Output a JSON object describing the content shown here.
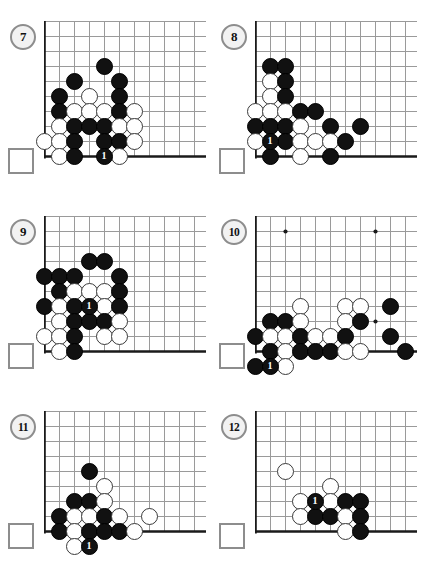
{
  "page": {
    "width": 415,
    "height": 570,
    "background": "#ffffff",
    "black_color": "#111111",
    "white_color": "#ffffff",
    "line_color": "#9a9a9a",
    "edge_color": "#1a1a1a",
    "marker_color": "#8d8d8d"
  },
  "layout": {
    "cell": 15,
    "stone_diameter": 17,
    "cols": 11,
    "rows": 10
  },
  "diagrams": [
    {
      "number": "7",
      "badge_label": "7",
      "square_marker": true,
      "origin_x": 44,
      "origin_y": 21,
      "cols": 11,
      "rows": 10,
      "star_points": [],
      "edges": [
        "left",
        "bottom"
      ],
      "stones": [
        {
          "c": 4,
          "r": 3,
          "color": "b",
          "label": ""
        },
        {
          "c": 2,
          "r": 4,
          "color": "b",
          "label": ""
        },
        {
          "c": 5,
          "r": 4,
          "color": "b",
          "label": ""
        },
        {
          "c": 1,
          "r": 5,
          "color": "b",
          "label": ""
        },
        {
          "c": 3,
          "r": 5,
          "color": "w",
          "label": ""
        },
        {
          "c": 5,
          "r": 5,
          "color": "b",
          "label": ""
        },
        {
          "c": 1,
          "r": 6,
          "color": "b",
          "label": ""
        },
        {
          "c": 2,
          "r": 6,
          "color": "w",
          "label": ""
        },
        {
          "c": 3,
          "r": 6,
          "color": "w",
          "label": ""
        },
        {
          "c": 4,
          "r": 6,
          "color": "w",
          "label": ""
        },
        {
          "c": 5,
          "r": 6,
          "color": "b",
          "label": ""
        },
        {
          "c": 6,
          "r": 6,
          "color": "w",
          "label": ""
        },
        {
          "c": 1,
          "r": 7,
          "color": "w",
          "label": ""
        },
        {
          "c": 2,
          "r": 7,
          "color": "b",
          "label": ""
        },
        {
          "c": 3,
          "r": 7,
          "color": "b",
          "label": ""
        },
        {
          "c": 4,
          "r": 7,
          "color": "b",
          "label": ""
        },
        {
          "c": 5,
          "r": 7,
          "color": "w",
          "label": ""
        },
        {
          "c": 6,
          "r": 7,
          "color": "w",
          "label": ""
        },
        {
          "c": 0,
          "r": 8,
          "color": "w",
          "label": ""
        },
        {
          "c": 1,
          "r": 8,
          "color": "w",
          "label": ""
        },
        {
          "c": 2,
          "r": 8,
          "color": "b",
          "label": ""
        },
        {
          "c": 4,
          "r": 8,
          "color": "b",
          "label": ""
        },
        {
          "c": 5,
          "r": 8,
          "color": "b",
          "label": ""
        },
        {
          "c": 6,
          "r": 8,
          "color": "w",
          "label": ""
        },
        {
          "c": 1,
          "r": 9,
          "color": "w",
          "label": ""
        },
        {
          "c": 2,
          "r": 9,
          "color": "b",
          "label": ""
        },
        {
          "c": 4,
          "r": 9,
          "color": "b",
          "label": "1"
        },
        {
          "c": 5,
          "r": 9,
          "color": "w",
          "label": ""
        }
      ]
    },
    {
      "number": "8",
      "badge_label": "8",
      "square_marker": true,
      "origin_x": 255,
      "origin_y": 21,
      "cols": 11,
      "rows": 10,
      "star_points": [],
      "edges": [
        "left",
        "bottom"
      ],
      "stones": [
        {
          "c": 1,
          "r": 3,
          "color": "b",
          "label": ""
        },
        {
          "c": 2,
          "r": 3,
          "color": "b",
          "label": ""
        },
        {
          "c": 1,
          "r": 4,
          "color": "w",
          "label": ""
        },
        {
          "c": 2,
          "r": 4,
          "color": "b",
          "label": ""
        },
        {
          "c": 1,
          "r": 5,
          "color": "w",
          "label": ""
        },
        {
          "c": 2,
          "r": 5,
          "color": "b",
          "label": ""
        },
        {
          "c": 0,
          "r": 6,
          "color": "w",
          "label": ""
        },
        {
          "c": 1,
          "r": 6,
          "color": "w",
          "label": ""
        },
        {
          "c": 2,
          "r": 6,
          "color": "w",
          "label": ""
        },
        {
          "c": 3,
          "r": 6,
          "color": "b",
          "label": ""
        },
        {
          "c": 4,
          "r": 6,
          "color": "b",
          "label": ""
        },
        {
          "c": 0,
          "r": 7,
          "color": "b",
          "label": ""
        },
        {
          "c": 1,
          "r": 7,
          "color": "b",
          "label": ""
        },
        {
          "c": 2,
          "r": 7,
          "color": "b",
          "label": ""
        },
        {
          "c": 3,
          "r": 7,
          "color": "w",
          "label": ""
        },
        {
          "c": 5,
          "r": 7,
          "color": "b",
          "label": ""
        },
        {
          "c": 7,
          "r": 7,
          "color": "b",
          "label": ""
        },
        {
          "c": 0,
          "r": 8,
          "color": "w",
          "label": ""
        },
        {
          "c": 1,
          "r": 8,
          "color": "b",
          "label": "1"
        },
        {
          "c": 2,
          "r": 8,
          "color": "b",
          "label": ""
        },
        {
          "c": 3,
          "r": 8,
          "color": "w",
          "label": ""
        },
        {
          "c": 4,
          "r": 8,
          "color": "w",
          "label": ""
        },
        {
          "c": 5,
          "r": 8,
          "color": "w",
          "label": ""
        },
        {
          "c": 6,
          "r": 8,
          "color": "b",
          "label": ""
        },
        {
          "c": 1,
          "r": 9,
          "color": "b",
          "label": ""
        },
        {
          "c": 3,
          "r": 9,
          "color": "w",
          "label": ""
        },
        {
          "c": 5,
          "r": 9,
          "color": "b",
          "label": ""
        }
      ]
    },
    {
      "number": "9",
      "badge_label": "9",
      "square_marker": true,
      "origin_x": 44,
      "origin_y": 216,
      "cols": 11,
      "rows": 10,
      "star_points": [],
      "edges": [
        "left",
        "bottom"
      ],
      "stones": [
        {
          "c": 3,
          "r": 3,
          "color": "b",
          "label": ""
        },
        {
          "c": 4,
          "r": 3,
          "color": "b",
          "label": ""
        },
        {
          "c": 0,
          "r": 4,
          "color": "b",
          "label": ""
        },
        {
          "c": 1,
          "r": 4,
          "color": "b",
          "label": ""
        },
        {
          "c": 2,
          "r": 4,
          "color": "b",
          "label": ""
        },
        {
          "c": 5,
          "r": 4,
          "color": "b",
          "label": ""
        },
        {
          "c": 1,
          "r": 5,
          "color": "b",
          "label": ""
        },
        {
          "c": 2,
          "r": 5,
          "color": "w",
          "label": ""
        },
        {
          "c": 3,
          "r": 5,
          "color": "w",
          "label": ""
        },
        {
          "c": 4,
          "r": 5,
          "color": "w",
          "label": ""
        },
        {
          "c": 5,
          "r": 5,
          "color": "b",
          "label": ""
        },
        {
          "c": 0,
          "r": 6,
          "color": "b",
          "label": ""
        },
        {
          "c": 1,
          "r": 6,
          "color": "w",
          "label": ""
        },
        {
          "c": 2,
          "r": 6,
          "color": "b",
          "label": ""
        },
        {
          "c": 3,
          "r": 6,
          "color": "b",
          "label": "1"
        },
        {
          "c": 4,
          "r": 6,
          "color": "w",
          "label": ""
        },
        {
          "c": 5,
          "r": 6,
          "color": "b",
          "label": ""
        },
        {
          "c": 1,
          "r": 7,
          "color": "w",
          "label": ""
        },
        {
          "c": 2,
          "r": 7,
          "color": "b",
          "label": ""
        },
        {
          "c": 3,
          "r": 7,
          "color": "b",
          "label": ""
        },
        {
          "c": 4,
          "r": 7,
          "color": "b",
          "label": ""
        },
        {
          "c": 5,
          "r": 7,
          "color": "w",
          "label": ""
        },
        {
          "c": 0,
          "r": 8,
          "color": "w",
          "label": ""
        },
        {
          "c": 1,
          "r": 8,
          "color": "w",
          "label": ""
        },
        {
          "c": 2,
          "r": 8,
          "color": "b",
          "label": ""
        },
        {
          "c": 4,
          "r": 8,
          "color": "w",
          "label": ""
        },
        {
          "c": 5,
          "r": 8,
          "color": "w",
          "label": ""
        },
        {
          "c": 1,
          "r": 9,
          "color": "w",
          "label": ""
        },
        {
          "c": 2,
          "r": 9,
          "color": "b",
          "label": ""
        }
      ]
    },
    {
      "number": "10",
      "badge_label": "10",
      "square_marker": true,
      "origin_x": 255,
      "origin_y": 216,
      "cols": 11,
      "rows": 10,
      "star_points": [
        {
          "c": 2,
          "r": 1
        },
        {
          "c": 8,
          "r": 1
        },
        {
          "c": 8,
          "r": 7
        }
      ],
      "edges": [
        "left",
        "bottom"
      ],
      "stones": [
        {
          "c": 3,
          "r": 6,
          "color": "w",
          "label": ""
        },
        {
          "c": 6,
          "r": 6,
          "color": "w",
          "label": ""
        },
        {
          "c": 7,
          "r": 6,
          "color": "w",
          "label": ""
        },
        {
          "c": 9,
          "r": 6,
          "color": "b",
          "label": ""
        },
        {
          "c": 1,
          "r": 7,
          "color": "b",
          "label": ""
        },
        {
          "c": 2,
          "r": 7,
          "color": "b",
          "label": ""
        },
        {
          "c": 3,
          "r": 7,
          "color": "w",
          "label": ""
        },
        {
          "c": 6,
          "r": 7,
          "color": "w",
          "label": ""
        },
        {
          "c": 7,
          "r": 7,
          "color": "b",
          "label": ""
        },
        {
          "c": 0,
          "r": 8,
          "color": "b",
          "label": ""
        },
        {
          "c": 1,
          "r": 8,
          "color": "w",
          "label": ""
        },
        {
          "c": 2,
          "r": 8,
          "color": "w",
          "label": ""
        },
        {
          "c": 3,
          "r": 8,
          "color": "b",
          "label": ""
        },
        {
          "c": 4,
          "r": 8,
          "color": "w",
          "label": ""
        },
        {
          "c": 5,
          "r": 8,
          "color": "w",
          "label": ""
        },
        {
          "c": 6,
          "r": 8,
          "color": "b",
          "label": ""
        },
        {
          "c": 9,
          "r": 8,
          "color": "b",
          "label": ""
        },
        {
          "c": 1,
          "r": 9,
          "color": "b",
          "label": ""
        },
        {
          "c": 2,
          "r": 9,
          "color": "w",
          "label": ""
        },
        {
          "c": 3,
          "r": 9,
          "color": "b",
          "label": ""
        },
        {
          "c": 4,
          "r": 9,
          "color": "b",
          "label": ""
        },
        {
          "c": 5,
          "r": 9,
          "color": "b",
          "label": ""
        },
        {
          "c": 6,
          "r": 9,
          "color": "w",
          "label": ""
        },
        {
          "c": 7,
          "r": 9,
          "color": "w",
          "label": ""
        },
        {
          "c": 10,
          "r": 9,
          "color": "b",
          "label": ""
        },
        {
          "c": 0,
          "r": 10,
          "color": "b",
          "label": ""
        },
        {
          "c": 1,
          "r": 10,
          "color": "b",
          "label": "1"
        },
        {
          "c": 2,
          "r": 10,
          "color": "w",
          "label": ""
        }
      ]
    },
    {
      "number": "11",
      "badge_label": "11",
      "square_marker": true,
      "origin_x": 44,
      "origin_y": 411,
      "cols": 11,
      "rows": 9,
      "star_points": [],
      "edges": [
        "left",
        "bottom"
      ],
      "stones": [
        {
          "c": 3,
          "r": 4,
          "color": "b",
          "label": ""
        },
        {
          "c": 4,
          "r": 5,
          "color": "w",
          "label": ""
        },
        {
          "c": 2,
          "r": 6,
          "color": "b",
          "label": ""
        },
        {
          "c": 3,
          "r": 6,
          "color": "b",
          "label": ""
        },
        {
          "c": 4,
          "r": 6,
          "color": "w",
          "label": ""
        },
        {
          "c": 1,
          "r": 7,
          "color": "b",
          "label": ""
        },
        {
          "c": 2,
          "r": 7,
          "color": "w",
          "label": ""
        },
        {
          "c": 3,
          "r": 7,
          "color": "w",
          "label": ""
        },
        {
          "c": 4,
          "r": 7,
          "color": "b",
          "label": ""
        },
        {
          "c": 5,
          "r": 7,
          "color": "w",
          "label": ""
        },
        {
          "c": 7,
          "r": 7,
          "color": "w",
          "label": ""
        },
        {
          "c": 1,
          "r": 8,
          "color": "b",
          "label": ""
        },
        {
          "c": 2,
          "r": 8,
          "color": "w",
          "label": ""
        },
        {
          "c": 3,
          "r": 8,
          "color": "b",
          "label": ""
        },
        {
          "c": 4,
          "r": 8,
          "color": "b",
          "label": ""
        },
        {
          "c": 5,
          "r": 8,
          "color": "b",
          "label": ""
        },
        {
          "c": 6,
          "r": 8,
          "color": "w",
          "label": ""
        },
        {
          "c": 2,
          "r": 9,
          "color": "w",
          "label": ""
        },
        {
          "c": 3,
          "r": 9,
          "color": "b",
          "label": "1"
        }
      ]
    },
    {
      "number": "12",
      "badge_label": "12",
      "square_marker": true,
      "origin_x": 255,
      "origin_y": 411,
      "cols": 11,
      "rows": 9,
      "star_points": [],
      "edges": [
        "left",
        "bottom"
      ],
      "stones": [
        {
          "c": 2,
          "r": 4,
          "color": "w",
          "label": ""
        },
        {
          "c": 5,
          "r": 5,
          "color": "w",
          "label": ""
        },
        {
          "c": 3,
          "r": 6,
          "color": "w",
          "label": ""
        },
        {
          "c": 4,
          "r": 6,
          "color": "b",
          "label": "1"
        },
        {
          "c": 5,
          "r": 6,
          "color": "w",
          "label": ""
        },
        {
          "c": 6,
          "r": 6,
          "color": "b",
          "label": ""
        },
        {
          "c": 7,
          "r": 6,
          "color": "b",
          "label": ""
        },
        {
          "c": 3,
          "r": 7,
          "color": "w",
          "label": ""
        },
        {
          "c": 4,
          "r": 7,
          "color": "b",
          "label": ""
        },
        {
          "c": 5,
          "r": 7,
          "color": "b",
          "label": ""
        },
        {
          "c": 6,
          "r": 7,
          "color": "w",
          "label": ""
        },
        {
          "c": 7,
          "r": 7,
          "color": "b",
          "label": ""
        },
        {
          "c": 6,
          "r": 8,
          "color": "w",
          "label": ""
        },
        {
          "c": 7,
          "r": 8,
          "color": "b",
          "label": ""
        }
      ]
    }
  ],
  "badges": [
    {
      "label": "7",
      "x": 10,
      "y": 24
    },
    {
      "label": "8",
      "x": 221,
      "y": 24
    },
    {
      "label": "9",
      "x": 10,
      "y": 219
    },
    {
      "label": "10",
      "x": 221,
      "y": 219
    },
    {
      "label": "11",
      "x": 10,
      "y": 414
    },
    {
      "label": "12",
      "x": 221,
      "y": 414
    }
  ],
  "square_markers": [
    {
      "x": 8,
      "y": 148
    },
    {
      "x": 219,
      "y": 148
    },
    {
      "x": 8,
      "y": 343
    },
    {
      "x": 219,
      "y": 343
    },
    {
      "x": 8,
      "y": 523
    },
    {
      "x": 219,
      "y": 523
    }
  ]
}
